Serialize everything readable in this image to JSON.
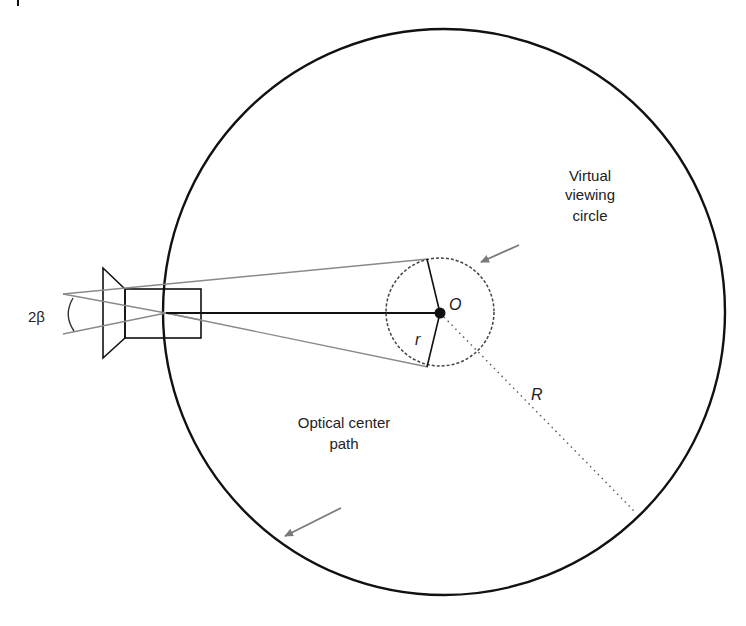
{
  "diagram": {
    "type": "geometry",
    "colors": {
      "stroke": "#111111",
      "ray": "#8a8a8a",
      "leader": "#7a7a7a",
      "text": "#222222",
      "background": "#ffffff"
    },
    "labels": {
      "angle": "2β",
      "center": "O",
      "small_radius": "r",
      "large_radius": "R",
      "virtual_viewing_circle": [
        "Virtual",
        "viewing",
        "circle"
      ],
      "optical_center_path": [
        "Optical center",
        "path"
      ]
    },
    "elements": {
      "optical_center_path_circle": {
        "cx": 444,
        "cy": 312,
        "rx": 281,
        "ry": 283
      },
      "virtual_viewing_circle": {
        "cx": 440,
        "cy": 312,
        "r": 54
      },
      "center_point": {
        "x": 440,
        "y": 312
      },
      "camera": {
        "lens": [
          [
            103,
            268
          ],
          [
            125,
            289
          ],
          [
            125,
            338
          ],
          [
            103,
            358
          ]
        ],
        "body": {
          "x": 125,
          "y": 289,
          "w": 76,
          "h": 49
        }
      }
    }
  }
}
